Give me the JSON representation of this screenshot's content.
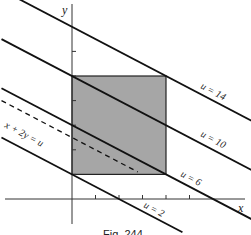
{
  "figure": {
    "caption": "Fig. 244",
    "x_axis_label": "x",
    "y_axis_label": "y",
    "region_fill_color": "#a6a6a6",
    "line_color": "#111111",
    "region": {
      "x_range": [
        0,
        4
      ],
      "y_range": [
        1,
        5
      ]
    },
    "x_ticks": [
      1,
      2,
      3,
      4,
      5
    ],
    "y_ticks": [
      1,
      2,
      3,
      4,
      5,
      6
    ],
    "dashed_line": {
      "label": "x + 2y = u",
      "u": 5
    },
    "level_lines": [
      {
        "u": 14,
        "label": "u = 14"
      },
      {
        "u": 10,
        "label": "u = 10"
      },
      {
        "u": 6,
        "label": "u = 6"
      },
      {
        "u": 2,
        "label": "u = 2"
      }
    ]
  }
}
